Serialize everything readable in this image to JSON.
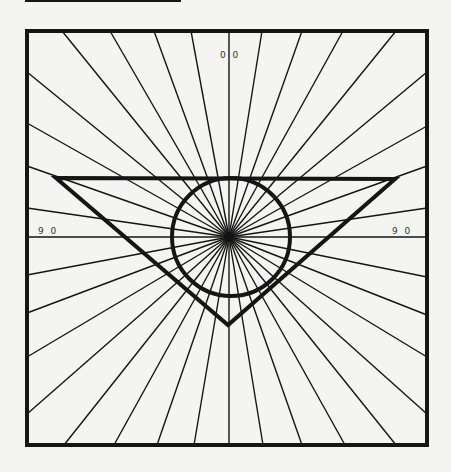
{
  "figure": {
    "colors": {
      "background": "#f4f4f2",
      "ink": "#151515"
    },
    "center": {
      "x": 229,
      "y": 237
    },
    "frame": {
      "x": 27,
      "y": 31,
      "width": 400,
      "height": 414,
      "stroke_width": 4
    },
    "top_rule": {
      "x1": 25,
      "y1": 1,
      "x2": 181,
      "y2": 1
    },
    "triangle": {
      "points": [
        [
          56,
          178
        ],
        [
          395,
          179
        ],
        [
          228,
          325
        ]
      ],
      "stroke_width": 4
    },
    "circle": {
      "cx": 231,
      "cy": 237,
      "r": 59,
      "stroke_width": 4
    },
    "rays": {
      "top_x": [
        62,
        110,
        154,
        191,
        229,
        262,
        302,
        343,
        396
      ],
      "bottom_x": [
        64,
        114,
        157,
        194,
        229,
        263,
        302,
        345,
        396
      ],
      "left_y": [
        72,
        123,
        166,
        208,
        275,
        313,
        357,
        414
      ],
      "right_y": [
        72,
        126,
        166,
        208,
        277,
        315,
        357,
        414
      ],
      "horizontal_y": 237
    },
    "labels": {
      "top": "0 0",
      "left": "9 0",
      "right": "9 0"
    }
  }
}
